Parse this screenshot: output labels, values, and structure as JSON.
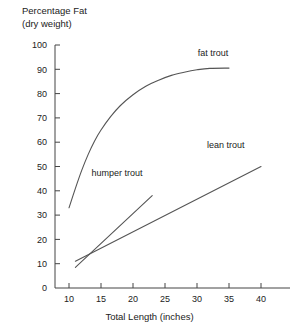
{
  "chart_data": {
    "type": "line",
    "title": "Percentage Fat (dry weight)",
    "title_line1": "Percentage Fat",
    "title_line2": "(dry weight)",
    "ylabel": "Percentage Fat (dry weight)",
    "xlabel": "Total Length (inches)",
    "xlim": [
      7.5,
      43
    ],
    "ylim": [
      0,
      104
    ],
    "grid": false,
    "legend_position": "inline-annotations",
    "yticks": [
      0,
      10,
      20,
      30,
      40,
      50,
      60,
      70,
      80,
      90,
      100
    ],
    "ytick_labels": [
      "0",
      "10",
      "20",
      "30",
      "40",
      "50",
      "60",
      "70",
      "80",
      "90",
      "100"
    ],
    "xticks": [
      10,
      15,
      20,
      25,
      30,
      35,
      40
    ],
    "xtick_labels": [
      "10",
      "15",
      "20",
      "25",
      "30",
      "35",
      "40"
    ],
    "series": [
      {
        "name": "fat trout",
        "label": "fat trout",
        "shape": "curve",
        "color": "#555555",
        "points": [
          [
            10.0,
            33.0
          ],
          [
            11.0,
            41.0
          ],
          [
            12.0,
            48.5
          ],
          [
            13.0,
            55.0
          ],
          [
            14.0,
            60.5
          ],
          [
            15.0,
            65.0
          ],
          [
            16.5,
            70.5
          ],
          [
            18.0,
            75.0
          ],
          [
            20.0,
            79.5
          ],
          [
            22.0,
            83.0
          ],
          [
            24.0,
            85.5
          ],
          [
            26.0,
            87.5
          ],
          [
            28.0,
            88.8
          ],
          [
            30.0,
            89.8
          ],
          [
            32.0,
            90.4
          ],
          [
            35.0,
            90.5
          ]
        ]
      },
      {
        "name": "humper trout",
        "label": "humper trout",
        "shape": "line",
        "color": "#555555",
        "points": [
          [
            11.0,
            8.5
          ],
          [
            23.0,
            38.0
          ]
        ]
      },
      {
        "name": "lean trout",
        "label": "lean trout",
        "shape": "line",
        "color": "#555555",
        "points": [
          [
            11.0,
            11.0
          ],
          [
            40.0,
            50.0
          ]
        ]
      }
    ],
    "annotations": [
      {
        "text": "fat trout",
        "x": 32.5,
        "y": 95.5
      },
      {
        "text": "lean trout",
        "x": 34.5,
        "y": 57.5
      },
      {
        "text": "humper trout",
        "x": 17.5,
        "y": 46.0
      }
    ]
  }
}
